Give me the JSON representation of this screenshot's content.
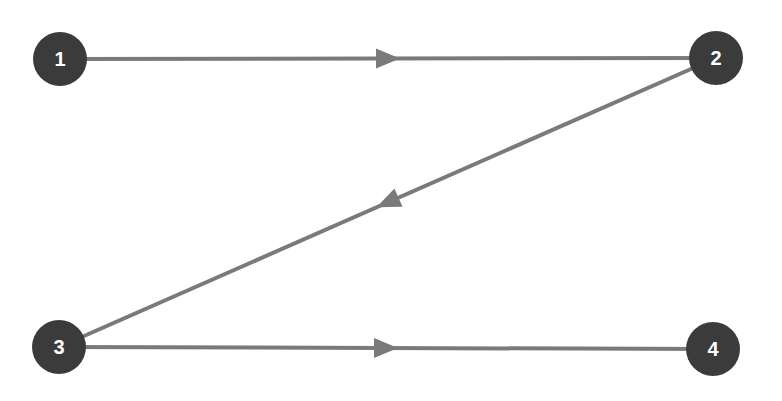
{
  "diagram": {
    "type": "directed-graph",
    "colors": {
      "background": "#ffffff",
      "node_fill": "#3b3b3b",
      "node_text": "#ffffff",
      "edge": "#7a7a7a",
      "arrow": "#7a7a7a"
    },
    "nodes": [
      {
        "id": "1",
        "label": "1",
        "x": 60,
        "y": 59,
        "r": 27
      },
      {
        "id": "2",
        "label": "2",
        "x": 716,
        "y": 58,
        "r": 27
      },
      {
        "id": "3",
        "label": "3",
        "x": 59,
        "y": 347,
        "r": 27
      },
      {
        "id": "4",
        "label": "4",
        "x": 713,
        "y": 349,
        "r": 27
      }
    ],
    "edges": [
      {
        "from": "1",
        "to": "2"
      },
      {
        "from": "2",
        "to": "3"
      },
      {
        "from": "3",
        "to": "4"
      }
    ]
  }
}
